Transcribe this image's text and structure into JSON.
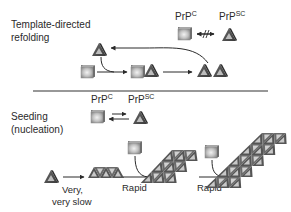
{
  "panels": {
    "top": {
      "title_line1": "Template-directed",
      "title_line2": "refolding",
      "legend": {
        "prpc": "PrP",
        "prpc_sup": "C",
        "prpsc": "PrP",
        "prpsc_sup": "SC",
        "relation": "blocked-equilibrium-arrow"
      }
    },
    "bottom": {
      "title_line1": "Seeding",
      "title_line2": "(nucleation)",
      "legend": {
        "prpc": "PrP",
        "prpc_sup": "C",
        "prpsc": "PrP",
        "prpsc_sup": "SC",
        "relation": "equilibrium-arrow"
      },
      "step1_line1": "Very,",
      "step1_line2": "very slow",
      "step2": "Rapid",
      "step3": "Rapid"
    }
  },
  "colors": {
    "ink": "#2a2a2a",
    "cube_light": "#d8d8d8",
    "cube_dark": "#8a8a8a",
    "tri_dark": "#4a4a4a",
    "tri_light": "#bdbdbd",
    "divider": "#333333"
  },
  "icons": [
    "cube-prpc-icon",
    "triangle-prpsc-icon",
    "fibril-icon"
  ]
}
